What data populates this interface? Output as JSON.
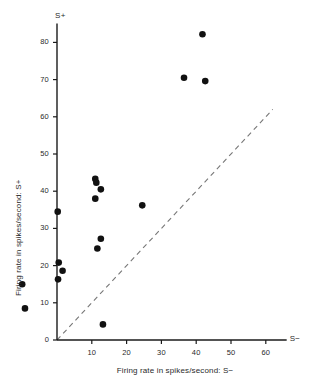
{
  "chart_data": {
    "type": "scatter",
    "title": "",
    "xlabel": "Firing rate in spikes/second: S−",
    "ylabel": "Firing rate in spikes/second: S+",
    "x_axis_end_label": "S−",
    "y_axis_end_label": "S+",
    "xlim": [
      -12,
      66
    ],
    "ylim": [
      0,
      84
    ],
    "xticks": [
      10,
      20,
      30,
      40,
      50,
      60
    ],
    "yticks": [
      0,
      10,
      20,
      30,
      40,
      50,
      60,
      70,
      80
    ],
    "xtick_labels": [
      "10",
      "20",
      "30",
      "40",
      "50",
      "60"
    ],
    "ytick_labels": [
      "0",
      "10",
      "20",
      "30",
      "40",
      "50",
      "60",
      "70",
      "80"
    ],
    "grid": false,
    "legend": false,
    "marker": "filled-circle",
    "marker_color": "#111111",
    "marker_size": 4.6,
    "reference_line": {
      "name": "identity-line",
      "style": "dashed",
      "color": "#777777",
      "from": [
        0,
        0
      ],
      "to": [
        62,
        62
      ],
      "description": "diagonal line of equality y = x"
    },
    "points": [
      {
        "x": -10.0,
        "y": 15.0
      },
      {
        "x": -9.2,
        "y": 8.5
      },
      {
        "x": 0.2,
        "y": 34.5
      },
      {
        "x": 0.5,
        "y": 20.8
      },
      {
        "x": 0.3,
        "y": 16.3
      },
      {
        "x": 1.6,
        "y": 18.6
      },
      {
        "x": 11.0,
        "y": 43.3
      },
      {
        "x": 11.3,
        "y": 42.3
      },
      {
        "x": 12.6,
        "y": 40.5
      },
      {
        "x": 11.0,
        "y": 38.0
      },
      {
        "x": 12.6,
        "y": 27.2
      },
      {
        "x": 11.6,
        "y": 24.6
      },
      {
        "x": 13.2,
        "y": 4.2
      },
      {
        "x": 24.5,
        "y": 36.2
      },
      {
        "x": 36.5,
        "y": 70.5
      },
      {
        "x": 41.8,
        "y": 82.2
      },
      {
        "x": 42.6,
        "y": 69.6
      }
    ]
  },
  "axes_pixels": {
    "origin_x": 57,
    "origin_y": 340,
    "px_per_x_unit": 3.48,
    "px_per_y_unit": 3.72
  }
}
